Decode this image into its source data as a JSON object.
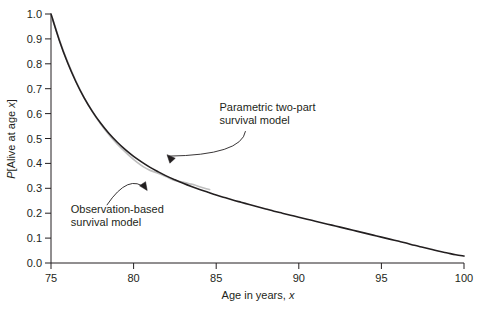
{
  "chart_data": {
    "type": "line",
    "title": "",
    "xlabel": "Age in years, x",
    "ylabel": "P[Alive at age x]",
    "xlim": [
      75,
      100
    ],
    "ylim": [
      0.0,
      1.0
    ],
    "grid": false,
    "legend_position": "none",
    "xticks": [
      75,
      80,
      85,
      90,
      95,
      100
    ],
    "xtick_labels": [
      "75",
      "80",
      "85",
      "90",
      "95",
      "100"
    ],
    "yticks": [
      0.0,
      0.1,
      0.2,
      0.3,
      0.4,
      0.5,
      0.6,
      0.7,
      0.8,
      0.9,
      1.0
    ],
    "ytick_labels": [
      "0.0",
      "0.1",
      "0.2",
      "0.3",
      "0.4",
      "0.5",
      "0.6",
      "0.7",
      "0.8",
      "0.9",
      "1.0"
    ],
    "series": [
      {
        "name": "Parametric two-part survival model",
        "color": "#231f20",
        "width": 1.6,
        "x": [
          75,
          75.5,
          76,
          76.5,
          77,
          77.5,
          78,
          78.5,
          79,
          79.5,
          80,
          80.5,
          81,
          81.5,
          82,
          82.5,
          83,
          83.5,
          84,
          84.5,
          85,
          85.5,
          86,
          86.5,
          87,
          87.5,
          88,
          88.5,
          89,
          89.5,
          90,
          90.5,
          91,
          91.5,
          92,
          92.5,
          93,
          93.5,
          94,
          94.5,
          95,
          95.5,
          96,
          96.5,
          97,
          97.5,
          98,
          98.5,
          99,
          99.5,
          100
        ],
        "y": [
          1.0,
          0.895,
          0.805,
          0.729,
          0.664,
          0.609,
          0.562,
          0.521,
          0.486,
          0.455,
          0.428,
          0.405,
          0.384,
          0.366,
          0.349,
          0.334,
          0.32,
          0.307,
          0.295,
          0.284,
          0.273,
          0.263,
          0.253,
          0.244,
          0.235,
          0.226,
          0.217,
          0.208,
          0.2,
          0.192,
          0.184,
          0.176,
          0.168,
          0.16,
          0.152,
          0.144,
          0.136,
          0.128,
          0.12,
          0.112,
          0.104,
          0.096,
          0.088,
          0.08,
          0.071,
          0.063,
          0.055,
          0.047,
          0.04,
          0.033,
          0.028
        ]
      },
      {
        "name": "Observation-based survival model",
        "color": "#bfbfbf",
        "width": 1.7,
        "x": [
          75,
          75.4,
          75.8,
          76.2,
          76.6,
          77,
          77.4,
          77.8,
          78.2,
          78.6,
          79,
          79.4,
          79.8,
          80.2,
          80.6,
          81,
          81.3,
          81.6,
          82,
          82.4,
          82.8,
          83.1,
          83.4,
          83.7,
          84,
          84.3,
          84.6
        ],
        "y": [
          1.0,
          0.918,
          0.842,
          0.777,
          0.717,
          0.664,
          0.62,
          0.578,
          0.541,
          0.508,
          0.478,
          0.452,
          0.427,
          0.405,
          0.386,
          0.372,
          0.365,
          0.358,
          0.346,
          0.334,
          0.327,
          0.323,
          0.318,
          0.313,
          0.306,
          0.3,
          0.295
        ]
      }
    ],
    "annotations": [
      {
        "id": "parametric-label",
        "text_lines": [
          "Parametric two-part",
          "survival model"
        ],
        "text_x": 85.2,
        "text_y": 0.61,
        "arrow_tip_x": 81.5,
        "arrow_tip_y": 0.385
      },
      {
        "id": "observation-label",
        "text_lines": [
          "Observation-based",
          "survival model"
        ],
        "text_x": 76.2,
        "text_y": 0.2,
        "arrow_tip_x": 81.3,
        "arrow_tip_y": 0.35
      }
    ]
  }
}
